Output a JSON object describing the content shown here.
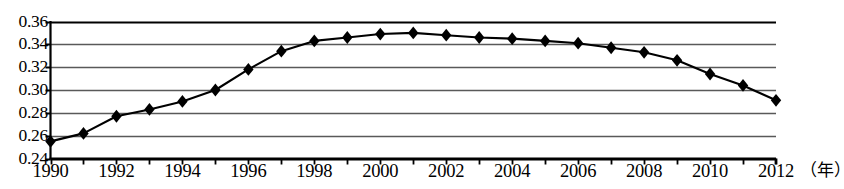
{
  "chart_data": {
    "type": "line",
    "title": "",
    "subtitle": "",
    "xlabel": "（年）",
    "ylabel": "",
    "x": [
      1990,
      1991,
      1992,
      1993,
      1994,
      1995,
      1996,
      1997,
      1998,
      1999,
      2000,
      2001,
      2002,
      2003,
      2004,
      2005,
      2006,
      2007,
      2008,
      2009,
      2010,
      2011,
      2012
    ],
    "values": [
      0.255,
      0.262,
      0.277,
      0.283,
      0.29,
      0.3,
      0.318,
      0.334,
      0.343,
      0.346,
      0.349,
      0.35,
      0.348,
      0.346,
      0.345,
      0.343,
      0.341,
      0.337,
      0.333,
      0.326,
      0.314,
      0.304,
      0.291
    ],
    "series": [
      {
        "name": "",
        "values": [
          0.255,
          0.262,
          0.277,
          0.283,
          0.29,
          0.3,
          0.318,
          0.334,
          0.343,
          0.346,
          0.349,
          0.35,
          0.348,
          0.346,
          0.345,
          0.343,
          0.341,
          0.337,
          0.333,
          0.326,
          0.314,
          0.304,
          0.291
        ]
      }
    ],
    "xlim": [
      1990,
      2012
    ],
    "ylim": [
      0.24,
      0.36
    ],
    "ytick_labels": [
      "0.36",
      "0.34",
      "0.32",
      "0.30",
      "0.28",
      "0.26",
      "0.24"
    ],
    "ytick_values": [
      0.36,
      0.34,
      0.32,
      0.3,
      0.28,
      0.26,
      0.24
    ],
    "xtick_labels": [
      "1990",
      "1992",
      "1994",
      "1996",
      "1998",
      "2000",
      "2002",
      "2004",
      "2006",
      "2008",
      "2010",
      "2012"
    ],
    "xtick_values": [
      1990,
      1992,
      1994,
      1996,
      1998,
      2000,
      2002,
      2004,
      2006,
      2008,
      2010,
      2012
    ],
    "grid": "horizontal",
    "legend": "none",
    "marker": "diamond",
    "line_color": "#000000",
    "marker_color": "#000000",
    "grid_color": "#595959",
    "axis_color": "#000000",
    "background_color": "#ffffff"
  }
}
